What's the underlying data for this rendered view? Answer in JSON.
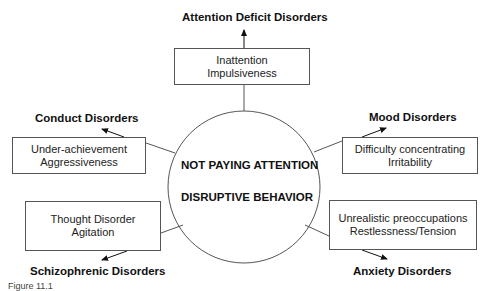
{
  "center": {
    "line1": "NOT PAYING ATTENTION",
    "line2": "DISRUPTIVE BEHAVIOR"
  },
  "nodes": [
    {
      "id": "top",
      "disorder": "Attention Deficit Disorders",
      "symptoms": [
        "Inattention",
        "Impulsiveness"
      ]
    },
    {
      "id": "upper-left",
      "disorder": "Conduct Disorders",
      "symptoms": [
        "Under-achievement",
        "Aggressiveness"
      ]
    },
    {
      "id": "upper-right",
      "disorder": "Mood Disorders",
      "symptoms": [
        "Difficulty concentrating",
        "Irritability"
      ]
    },
    {
      "id": "lower-left",
      "disorder": "Schizophrenic Disorders",
      "symptoms": [
        "Thought Disorder",
        "Agitation"
      ]
    },
    {
      "id": "lower-right",
      "disorder": "Anxiety Disorders",
      "symptoms": [
        "Unrealistic preoccupations",
        "Restlessness/Tension"
      ]
    }
  ],
  "caption": "Figure 11.1"
}
